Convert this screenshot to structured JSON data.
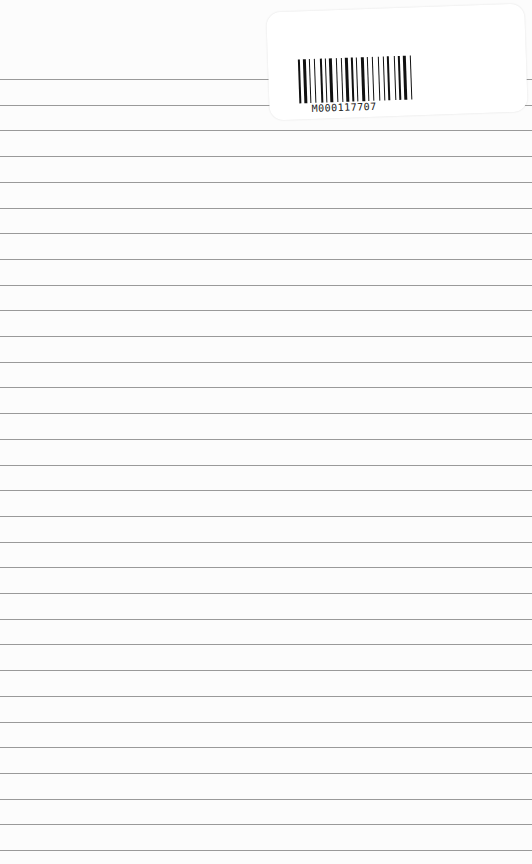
{
  "page": {
    "type": "lined-paper",
    "background": "#fcfcfc",
    "line_color": "#9a9a9a",
    "first_line_y": 79,
    "line_spacing": 25.7,
    "line_count": 31
  },
  "sticker": {
    "barcode_text": "M000117707"
  }
}
